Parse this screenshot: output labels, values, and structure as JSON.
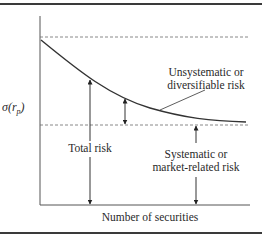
{
  "diagram": {
    "type": "portfolio-risk-diversification",
    "y_axis_label": "σ(r",
    "y_axis_label_sub": "p",
    "y_axis_label_close": ")",
    "x_axis_label": "Number of securities",
    "labels": {
      "unsystematic_line1": "Unsystematic or",
      "unsystematic_line2": "diversifiable risk",
      "total": "Total risk",
      "systematic_line1": "Systematic or",
      "systematic_line2": "market-related risk"
    },
    "colors": {
      "line": "#3a3a3a",
      "dashed": "#6a6a6a",
      "text": "#2a2a2a",
      "background": "#ffffff"
    }
  }
}
